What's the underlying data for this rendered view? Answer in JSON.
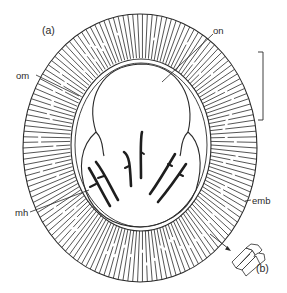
{
  "figure": {
    "panel_a_label": "(a)",
    "panel_b_label": "(b)",
    "labels": {
      "on": "on",
      "om": "om",
      "mh": "mh",
      "emb": "emb"
    },
    "colors": {
      "ink": "#2a2a2a",
      "background": "#ffffff"
    },
    "elements": [
      {
        "id": "embryophore",
        "label": "emb",
        "description": "outer striated radial shell"
      },
      {
        "id": "outer-membrane",
        "label": "om",
        "description": "outer membrane"
      },
      {
        "id": "oncosphere",
        "label": "on",
        "description": "oncosphere"
      },
      {
        "id": "hooks",
        "label": "mh",
        "description": "six embryonic hooks"
      },
      {
        "id": "scale-bar",
        "label": "",
        "description": "vertical scale bar"
      },
      {
        "id": "inset-b",
        "label": "(b)",
        "description": "detail of embryophore blocks"
      }
    ]
  }
}
